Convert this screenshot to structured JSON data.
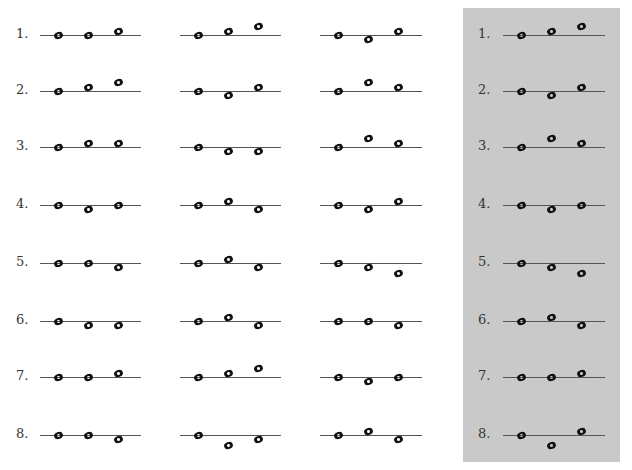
{
  "exercise": {
    "note_positions_legend": {
      "on": "note centered on line",
      "above": "note sitting on top of line",
      "higher": "note floating above line",
      "below": "note hanging just below line",
      "lower": "note floating further below line"
    },
    "row_labels": [
      "1.",
      "2.",
      "3.",
      "4.",
      "5.",
      "6.",
      "7.",
      "8."
    ],
    "columns": [
      {
        "rows": [
          [
            "on",
            "on",
            "above"
          ],
          [
            "on",
            "above",
            "higher"
          ],
          [
            "on",
            "above",
            "above"
          ],
          [
            "on",
            "below",
            "on"
          ],
          [
            "on",
            "on",
            "below"
          ],
          [
            "on",
            "below",
            "below"
          ],
          [
            "on",
            "on",
            "above"
          ],
          [
            "on",
            "on",
            "below"
          ]
        ]
      },
      {
        "rows": [
          [
            "on",
            "above",
            "higher"
          ],
          [
            "on",
            "below",
            "above"
          ],
          [
            "on",
            "below",
            "below"
          ],
          [
            "on",
            "above",
            "below"
          ],
          [
            "on",
            "above",
            "below"
          ],
          [
            "on",
            "above",
            "below"
          ],
          [
            "on",
            "above",
            "higher"
          ],
          [
            "on",
            "lower",
            "below"
          ]
        ]
      },
      {
        "rows": [
          [
            "on",
            "below",
            "above"
          ],
          [
            "on",
            "higher",
            "above"
          ],
          [
            "on",
            "higher",
            "above"
          ],
          [
            "on",
            "below",
            "above"
          ],
          [
            "on",
            "below",
            "lower"
          ],
          [
            "on",
            "on",
            "below"
          ],
          [
            "on",
            "below",
            "on"
          ],
          [
            "on",
            "above",
            "below"
          ]
        ]
      }
    ],
    "answer_panel": {
      "background": "#c9c9c9",
      "row_labels": [
        "1.",
        "2.",
        "3.",
        "4.",
        "5.",
        "6.",
        "7.",
        "8."
      ],
      "rows": [
        [
          "on",
          "above",
          "higher"
        ],
        [
          "on",
          "below",
          "above"
        ],
        [
          "on",
          "higher",
          "above"
        ],
        [
          "on",
          "below",
          "on"
        ],
        [
          "on",
          "below",
          "lower"
        ],
        [
          "on",
          "above",
          "below"
        ],
        [
          "on",
          "on",
          "above"
        ],
        [
          "on",
          "lower",
          "above"
        ]
      ]
    }
  }
}
